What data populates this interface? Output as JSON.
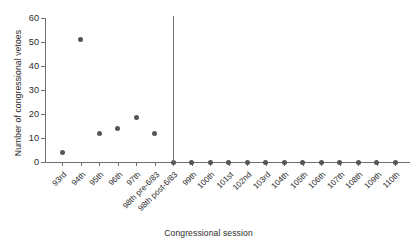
{
  "chart_data": {
    "type": "scatter",
    "title": "",
    "xlabel": "Congressional session",
    "ylabel": "Number of congressional vetoes",
    "categories": [
      "93rd",
      "94th",
      "95th",
      "96th",
      "97th",
      "98th pre-6/83",
      "98th post-6/83",
      "99th",
      "100th",
      "101st",
      "102nd",
      "103rd",
      "104th",
      "105th",
      "106th",
      "107th",
      "108th",
      "109th",
      "110th"
    ],
    "values": [
      4,
      51,
      12,
      14,
      18.5,
      12,
      0,
      0,
      0,
      0,
      0,
      0,
      0,
      0,
      0,
      0,
      0,
      0,
      0
    ],
    "ylim": [
      0,
      60
    ],
    "yticks": [
      0,
      10,
      20,
      30,
      40,
      50,
      60
    ],
    "ytick_labels": [
      "0",
      "10",
      "20",
      "30",
      "40",
      "50",
      "60"
    ],
    "grid": false,
    "legend": "none",
    "annotations": [
      {
        "name": "chadha-divider",
        "type": "vertical-line",
        "at_category": "98th post-6/83"
      }
    ],
    "marker": {
      "shape": "circle",
      "color": "#555555",
      "size": 5
    },
    "axis_color": "#6e6e6e"
  }
}
